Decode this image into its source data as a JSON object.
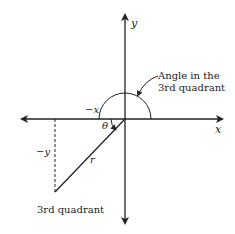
{
  "diagram": {
    "axes": {
      "x_label": "x",
      "y_label": "y",
      "neg_x_label": "−x",
      "neg_y_label": "−y"
    },
    "radius_label": "r",
    "angle_label": "θ",
    "annotation": {
      "line1": "Angle in the",
      "line2": "3rd quadrant"
    },
    "quadrant_label": "3rd quadrant",
    "colors": {
      "stroke": "#222222",
      "background": "#ffffff"
    }
  }
}
